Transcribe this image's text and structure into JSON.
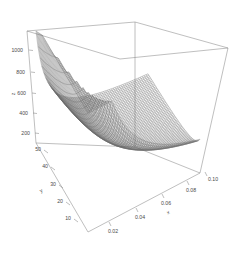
{
  "chart_data": {
    "type": "surface",
    "title": "",
    "xlabel": "x",
    "ylabel": "y",
    "zlabel": "z",
    "xticks": [
      "0.02",
      "0.04",
      "0.06",
      "0.08",
      "0.10"
    ],
    "xtickvals": [
      0.02,
      0.04,
      0.06,
      0.08,
      0.1
    ],
    "yticks": [
      "10",
      "20",
      "30",
      "40",
      "50"
    ],
    "ytickvals": [
      10,
      20,
      30,
      40,
      50
    ],
    "zticks": [
      "200",
      "400",
      "600",
      "800",
      "1000"
    ],
    "ztickvals": [
      200,
      400,
      600,
      800,
      1000
    ],
    "xlim": [
      0.01,
      0.11
    ],
    "ylim": [
      5,
      55
    ],
    "zlim": [
      0,
      1150
    ],
    "grid": false,
    "legend": "none",
    "surface_color": "#6e6e6e",
    "box_color": "#8a8a8a",
    "background": "#ffffff",
    "x": [
      0.01,
      0.02,
      0.03,
      0.04,
      0.05,
      0.06,
      0.07,
      0.08,
      0.09,
      0.1,
      0.11
    ],
    "y": [
      5,
      10,
      15,
      20,
      25,
      30,
      35,
      40,
      45,
      50,
      55
    ],
    "z": [
      [
        55,
        110,
        165,
        220,
        275,
        330,
        385,
        440,
        495,
        550,
        605
      ],
      [
        14,
        28,
        41,
        55,
        69,
        83,
        96,
        110,
        124,
        138,
        151
      ],
      [
        6,
        12,
        18,
        24,
        31,
        37,
        43,
        49,
        55,
        61,
        67
      ],
      [
        3,
        7,
        10,
        14,
        17,
        21,
        24,
        28,
        31,
        34,
        38
      ],
      [
        2,
        4,
        7,
        9,
        11,
        13,
        15,
        18,
        20,
        22,
        24
      ],
      [
        2,
        3,
        5,
        6,
        8,
        9,
        11,
        12,
        14,
        15,
        17
      ],
      [
        1,
        2,
        3,
        4,
        6,
        7,
        8,
        9,
        10,
        11,
        12
      ],
      [
        1,
        2,
        3,
        3,
        4,
        5,
        6,
        7,
        8,
        9,
        9
      ],
      [
        1,
        1,
        2,
        3,
        3,
        4,
        5,
        5,
        6,
        7,
        7
      ],
      [
        1,
        1,
        2,
        2,
        3,
        3,
        4,
        4,
        5,
        6,
        6
      ],
      [
        0,
        1,
        1,
        2,
        2,
        3,
        3,
        4,
        4,
        5,
        5
      ]
    ]
  },
  "axes": {
    "z": {
      "title": "z",
      "ticks": [
        {
          "label": "1000",
          "x": 23,
          "y": 50
        },
        {
          "label": "800",
          "x": 25,
          "y": 73
        },
        {
          "label": "600",
          "x": 27,
          "y": 94
        },
        {
          "label": "400",
          "x": 29,
          "y": 114
        },
        {
          "label": "200",
          "x": 31,
          "y": 133
        }
      ],
      "title_pos": {
        "x": 16,
        "y": 92
      }
    },
    "y": {
      "title": "y",
      "ticks": [
        {
          "label": "50",
          "x": 38,
          "y": 149
        },
        {
          "label": "40",
          "x": 45,
          "y": 165
        },
        {
          "label": "30",
          "x": 52,
          "y": 182
        },
        {
          "label": "20",
          "x": 60,
          "y": 200
        },
        {
          "label": "10",
          "x": 68,
          "y": 218
        }
      ],
      "title_pos": {
        "x": 44,
        "y": 190
      }
    },
    "x": {
      "title": "x",
      "ticks": [
        {
          "label": "0.02",
          "x": 110,
          "y": 235
        },
        {
          "label": "0.04",
          "x": 140,
          "y": 220
        },
        {
          "label": "0.06",
          "x": 165,
          "y": 207
        },
        {
          "label": "0.08",
          "x": 189,
          "y": 195
        },
        {
          "label": "0.10",
          "x": 212,
          "y": 182
        }
      ],
      "title_pos": {
        "x": 169,
        "y": 213
      }
    }
  }
}
